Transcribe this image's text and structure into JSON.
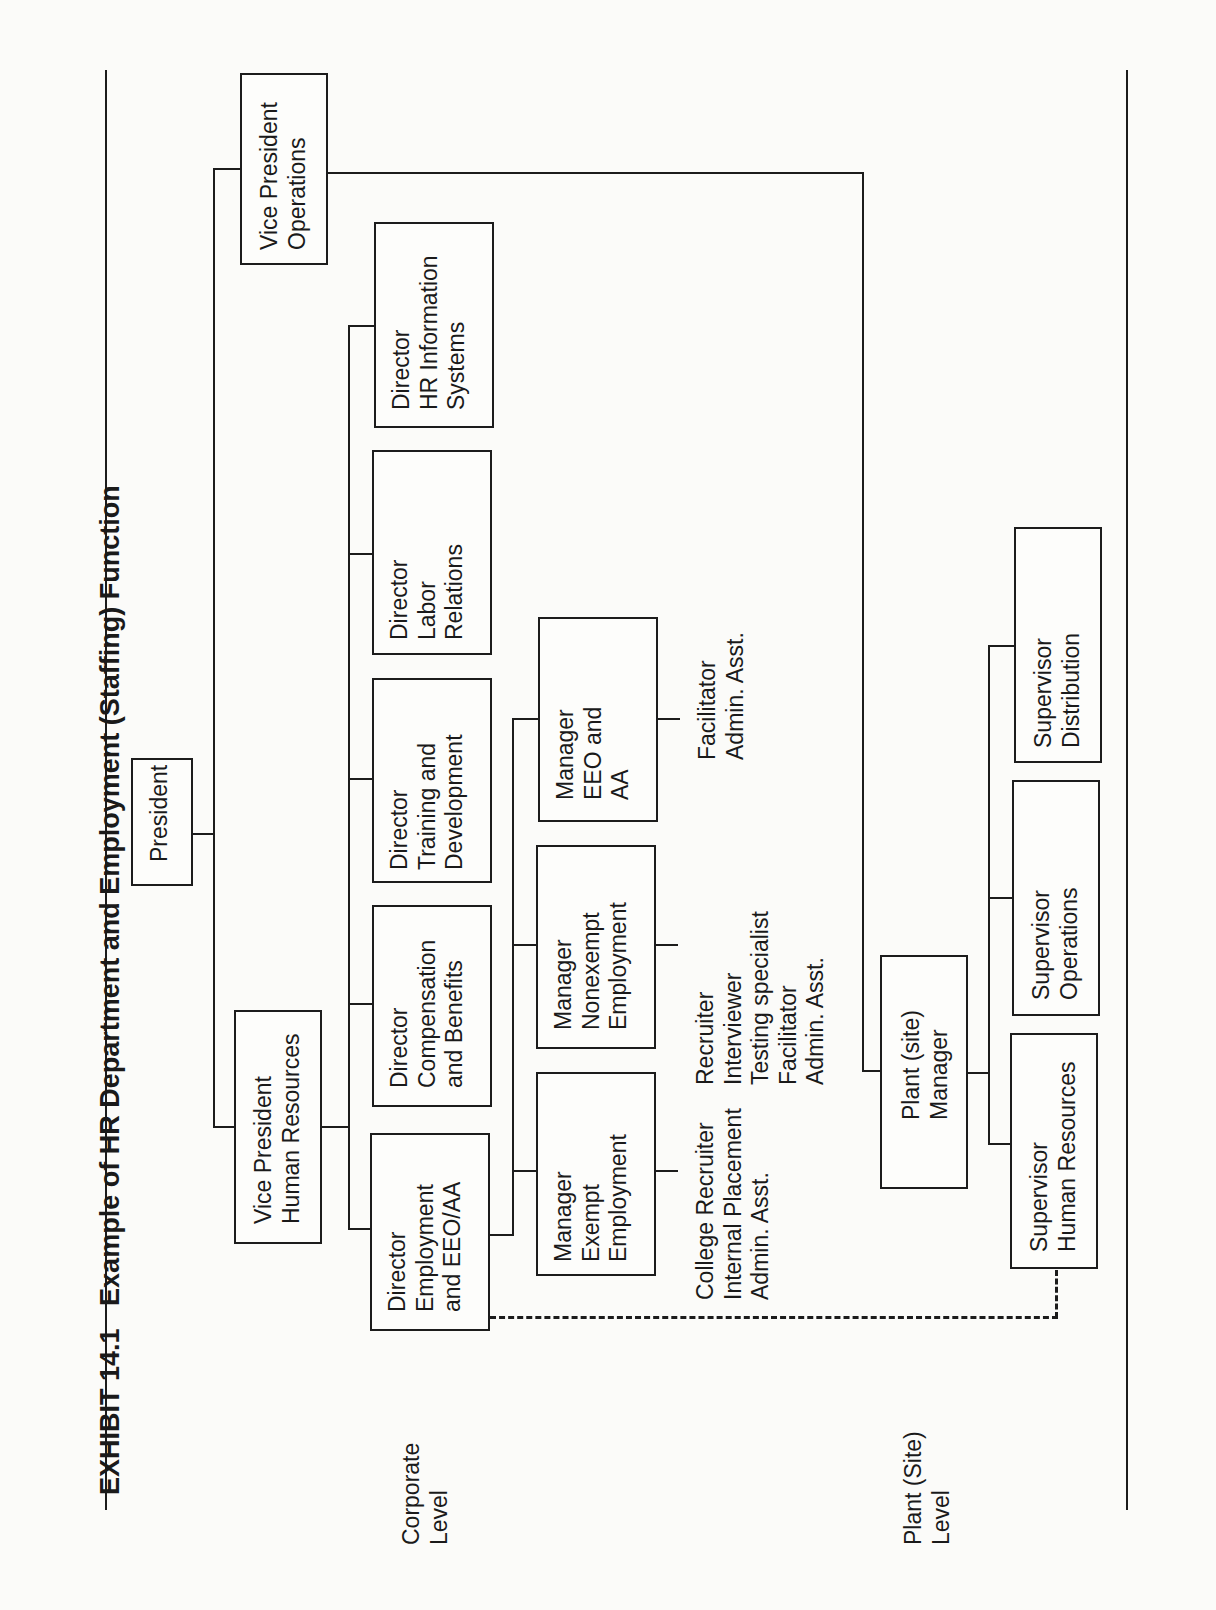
{
  "title": {
    "exhibit": "EXHIBIT 14.1",
    "text": "Example of HR Department and Employment (Staffing) Function"
  },
  "levels": {
    "corporate": "Corporate\nLevel",
    "plant": "Plant (Site)\nLevel"
  },
  "nodes": {
    "president": "President",
    "vp_hr": "Vice President\nHuman Resources",
    "vp_ops": "Vice President\nOperations",
    "dir_employment": "Director\nEmployment\nand EEO/AA",
    "dir_comp": "Director\nCompensation\nand Benefits",
    "dir_training": "Director\nTraining and\nDevelopment",
    "dir_labor": "Director\nLabor\nRelations",
    "dir_hris": "Director\nHR Information\nSystems",
    "mgr_exempt": "Manager\nExempt\nEmployment",
    "mgr_nonexempt": "Manager\nNonexempt\nEmployment",
    "mgr_eeo": "Manager\nEEO and\nAA",
    "plant_mgr": "Plant (site)\nManager",
    "sup_hr": "Supervisor\nHuman Resources",
    "sup_ops": "Supervisor\nOperations",
    "sup_dist": "Supervisor\nDistribution"
  },
  "staff": {
    "exempt": "College Recruiter\nInternal Placement\nAdmin. Asst.",
    "nonexempt": "Recruiter\nInterviewer\nTesting specialist\nFacilitator\nAdmin. Asst.",
    "eeo": "Facilitator\nAdmin. Asst."
  }
}
